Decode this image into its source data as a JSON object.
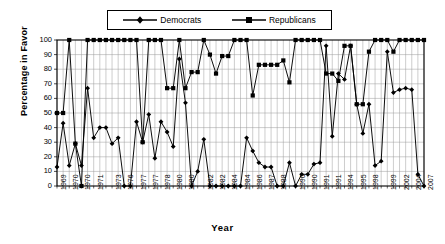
{
  "chart_data": {
    "type": "line",
    "title": "",
    "xlabel": "Year",
    "ylabel": "Percentage in Favor",
    "ylim": [
      0,
      100
    ],
    "ytick_values": [
      0,
      10,
      20,
      30,
      40,
      50,
      60,
      70,
      80,
      90,
      100
    ],
    "grid": true,
    "legend_position": "top-center",
    "marker_democrats": "diamond",
    "marker_republicans": "square",
    "line_color": "#000000",
    "series": [
      {
        "name": "Democrats",
        "values": [
          13,
          43,
          14,
          29,
          14,
          67,
          33,
          40,
          40,
          29,
          33,
          0,
          0,
          44,
          30,
          49,
          19,
          44,
          37,
          27,
          87,
          57,
          0,
          10,
          32,
          0,
          0,
          0,
          0,
          0,
          0,
          33,
          24,
          16,
          13,
          13,
          0,
          0,
          16,
          0,
          8,
          8,
          15,
          16,
          96,
          34,
          77,
          73,
          96,
          56,
          36,
          56,
          14,
          17,
          92,
          64,
          66,
          67,
          66,
          8,
          0
        ]
      },
      {
        "name": "Republicans",
        "values": [
          50,
          50,
          100,
          29,
          0,
          100,
          100,
          100,
          100,
          100,
          100,
          100,
          100,
          100,
          30,
          100,
          100,
          100,
          67,
          67,
          100,
          67,
          78,
          78,
          100,
          90,
          77,
          89,
          89,
          100,
          100,
          100,
          62,
          83,
          83,
          83,
          83,
          86,
          71,
          100,
          100,
          100,
          100,
          100,
          77,
          77,
          72,
          96,
          96,
          56,
          56,
          92,
          100,
          100,
          100,
          92,
          100,
          100,
          100,
          100,
          100
        ]
      }
    ],
    "x_tick_labels": [
      "1969",
      "1970",
      "1970",
      "1971",
      "1973",
      "1976",
      "1977",
      "1977",
      "1978",
      "1980",
      "1980",
      "1982",
      "1982",
      "1984",
      "1984",
      "1986",
      "1987",
      "1988",
      "1990",
      "1990",
      "1991",
      "1991",
      "1994",
      "1995",
      "1998",
      "1999",
      "2002",
      "2004",
      "2007"
    ]
  },
  "legend": {
    "entries": [
      {
        "label": "Democrats",
        "marker": "diamond"
      },
      {
        "label": "Republicans",
        "marker": "square"
      }
    ]
  }
}
